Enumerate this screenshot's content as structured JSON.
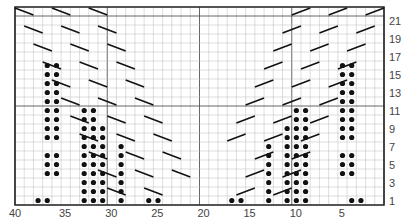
{
  "chart": {
    "columns": 40,
    "rows": 22,
    "column_labels": [
      "40",
      "35",
      "30",
      "25",
      "20",
      "15",
      "10",
      "5"
    ],
    "row_labels": [
      "21",
      "19",
      "17",
      "15",
      "13",
      "11",
      "9",
      "7",
      "5",
      "3",
      "1"
    ],
    "colors": {
      "grid": "#bbbbbb",
      "major": "#555555",
      "ink": "#111111"
    }
  },
  "chart_data": {
    "type": "table",
    "xlabel": "stitch",
    "ylabel": "row",
    "x_ticks": [
      40,
      35,
      30,
      25,
      20,
      15,
      10,
      5
    ],
    "y_ticks": [
      1,
      3,
      5,
      7,
      9,
      11,
      13,
      15,
      17,
      19,
      21
    ],
    "grid": true
  }
}
